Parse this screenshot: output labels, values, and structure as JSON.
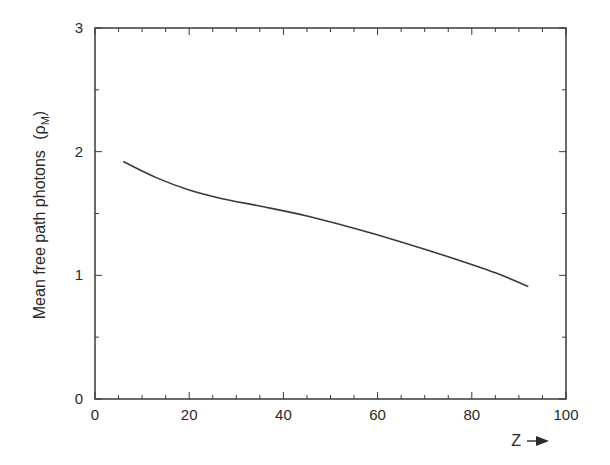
{
  "chart_data": {
    "type": "line",
    "title": "",
    "xlabel": "Z",
    "ylabel": "Mean free path photons (ρ_M)",
    "ylabel_main": "Mean free path photons",
    "ylabel_unit_symbol": "ρ",
    "ylabel_unit_sub": "M",
    "xlim": [
      0,
      100
    ],
    "ylim": [
      0,
      3
    ],
    "xticks": [
      0,
      20,
      40,
      60,
      80,
      100
    ],
    "yticks": [
      0,
      1,
      2,
      3
    ],
    "x_minor_step": 5,
    "y_minor_step": 0.5,
    "grid": false,
    "legend": null,
    "series": [
      {
        "name": "Mean free path photons",
        "x": [
          6,
          13,
          20,
          27,
          35,
          45,
          55,
          65,
          75,
          85,
          92
        ],
        "values": [
          1.92,
          1.79,
          1.69,
          1.62,
          1.56,
          1.48,
          1.38,
          1.27,
          1.15,
          1.02,
          0.91
        ]
      }
    ],
    "colors": {
      "line": "#3a3a3a",
      "axes": "#3a3a3a",
      "background": "#ffffff"
    }
  },
  "labels": {
    "x_axis": "Z",
    "x_arrow": "→",
    "tick_x": [
      "0",
      "20",
      "40",
      "60",
      "80",
      "100"
    ],
    "tick_y": [
      "0",
      "1",
      "2",
      "3"
    ]
  }
}
